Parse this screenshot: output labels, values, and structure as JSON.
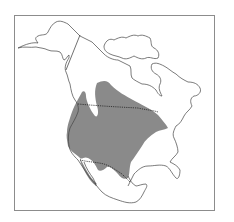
{
  "map": {
    "title": "",
    "region": "North America",
    "type": "species range map",
    "colors": {
      "background": "#ffffff",
      "frame": "#8c8c8c",
      "coastline": "#444444",
      "border": "#333333",
      "range_fill": "#8a8a8a"
    },
    "features": [
      {
        "name": "range-area",
        "description": "shaded range covering western and central United States and south-central Canada into northern Mexico"
      },
      {
        "name": "us-canada-border",
        "style": "dotted"
      },
      {
        "name": "us-mexico-border",
        "style": "dotted"
      },
      {
        "name": "alaska-canada-border",
        "style": "solid"
      }
    ]
  }
}
